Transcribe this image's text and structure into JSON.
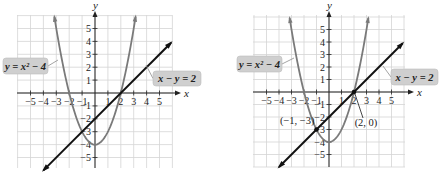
{
  "chart_data": [
    {
      "type": "line",
      "title": "",
      "xlabel": "x",
      "ylabel": "y",
      "xlim": [
        -6,
        6
      ],
      "ylim": [
        -6,
        6
      ],
      "grid": true,
      "x_ticks": [
        -5,
        -4,
        -3,
        -2,
        -1,
        1,
        2,
        3,
        4,
        5
      ],
      "x_tick_labels": [
        "−5",
        "−4",
        "−3",
        "−2",
        "−1",
        "1",
        "2",
        "3",
        "4",
        "5"
      ],
      "y_ticks": [
        5,
        4,
        3,
        2,
        1,
        -1,
        -2,
        -3,
        -4,
        -5
      ],
      "y_tick_labels": [
        "5",
        "4",
        "3",
        "2",
        "1",
        "−1",
        "−2",
        "−3",
        "−4",
        "−5"
      ],
      "series": [
        {
          "name": "y = x² − 4",
          "kind": "parabola",
          "equation": "y = x^2 - 4",
          "x_range": [
            -3.15,
            3.15
          ],
          "color": "#7a7a7a"
        },
        {
          "name": "x − y = 2",
          "kind": "line",
          "equation": "y = x - 2",
          "x_range": [
            -4,
            5.9
          ],
          "color": "#111111"
        }
      ],
      "annotations": [
        {
          "text": "y = x² − 4",
          "target_series": 0,
          "side": "left"
        },
        {
          "text": "x − y = 2",
          "target_series": 1,
          "side": "right"
        }
      ],
      "points": []
    },
    {
      "type": "line",
      "title": "",
      "xlabel": "x",
      "ylabel": "y",
      "xlim": [
        -6,
        6
      ],
      "ylim": [
        -6,
        6
      ],
      "grid": true,
      "x_ticks": [
        -5,
        -4,
        -3,
        -2,
        -1,
        1,
        2,
        3,
        4,
        5
      ],
      "x_tick_labels": [
        "−5",
        "−4",
        "−3",
        "−2",
        "−1",
        "1",
        "2",
        "3",
        "4",
        "5"
      ],
      "y_ticks": [
        5,
        4,
        3,
        2,
        1,
        -1,
        -2,
        -3,
        -4,
        -5
      ],
      "y_tick_labels": [
        "5",
        "4",
        "3",
        "2",
        "1",
        "−1",
        "−2",
        "−3",
        "−4",
        "−5"
      ],
      "series": [
        {
          "name": "y = x² − 4",
          "kind": "parabola",
          "equation": "y = x^2 - 4",
          "x_range": [
            -3.15,
            3.15
          ],
          "color": "#7a7a7a"
        },
        {
          "name": "x − y = 2",
          "kind": "line",
          "equation": "y = x - 2",
          "x_range": [
            -4,
            5.9
          ],
          "color": "#111111"
        }
      ],
      "annotations": [
        {
          "text": "y = x² − 4",
          "target_series": 0,
          "side": "left"
        },
        {
          "text": "x − y = 2",
          "target_series": 1,
          "side": "right"
        }
      ],
      "points": [
        {
          "x": -1,
          "y": -3,
          "label": "(−1, −3)"
        },
        {
          "x": 2,
          "y": 0,
          "label": "(2, 0)"
        }
      ]
    }
  ]
}
